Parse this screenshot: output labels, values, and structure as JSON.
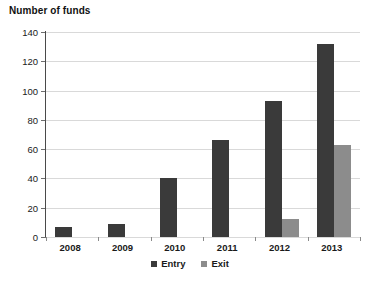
{
  "chart_data": {
    "type": "bar",
    "title": "Number of funds",
    "xlabel": "",
    "ylabel": "",
    "categories": [
      "2008",
      "2009",
      "2010",
      "2011",
      "2012",
      "2013"
    ],
    "series": [
      {
        "name": "Entry",
        "color": "#3a3a3a",
        "values": [
          7,
          9,
          40,
          66,
          93,
          132
        ]
      },
      {
        "name": "Exit",
        "color": "#8c8c8c",
        "values": [
          0,
          0,
          0,
          0,
          12,
          63
        ]
      }
    ],
    "ylim": [
      0,
      140
    ],
    "ytick_step": 20,
    "yticks": [
      0,
      20,
      40,
      60,
      80,
      100,
      120,
      140
    ],
    "ytick_labels": [
      "0",
      "20",
      "40",
      "60",
      "80",
      "100",
      "120",
      "140"
    ],
    "grid": true,
    "legend_position": "bottom-center",
    "background": "#ffffff"
  }
}
